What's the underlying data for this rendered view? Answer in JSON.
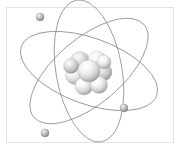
{
  "figure": {
    "caption": "",
    "background_color": "#ffffff",
    "frame": {
      "border_color": "#e2e2e2",
      "fill_color": "#ffffff",
      "x": 6,
      "y": 7,
      "width": 168,
      "height": 136
    },
    "nucleus": {
      "name": "nucleus",
      "center_x": 89,
      "center_y": 71,
      "radius": 23,
      "sphere_color_light": "#ffffff",
      "sphere_color_mid": "#d9d9d9",
      "sphere_color_dark": "#9a9a9a",
      "nucleon_count": 9,
      "nucleons": [
        {
          "cx": 80,
          "cy": 61,
          "r": 9.5
        },
        {
          "cx": 97,
          "cy": 60,
          "r": 9.0
        },
        {
          "cx": 75,
          "cy": 75,
          "r": 9.5
        },
        {
          "cx": 103,
          "cy": 72,
          "r": 9.0
        },
        {
          "cx": 84,
          "cy": 86,
          "r": 9.0
        },
        {
          "cx": 99,
          "cy": 85,
          "r": 8.5
        },
        {
          "cx": 71,
          "cy": 66,
          "r": 7.5
        },
        {
          "cx": 104,
          "cy": 62,
          "r": 7.0
        },
        {
          "cx": 89,
          "cy": 71,
          "r": 11.0
        }
      ]
    },
    "orbits": {
      "name": "electron-orbits",
      "stroke_color": "#8d8d8d",
      "stroke_width": 0.8,
      "center_x": 89,
      "center_y": 71,
      "radius_x": 72,
      "radius_y": 33,
      "count": 3,
      "rotations_deg": [
        20,
        80,
        140
      ]
    },
    "electrons": {
      "name": "electrons",
      "count": 3,
      "color_light": "#f2f2f2",
      "color_mid": "#c2c2c2",
      "color_dark": "#8a8a8a",
      "radius": 4,
      "positions": [
        {
          "label": "electron-top-left",
          "cx": 40,
          "cy": 17
        },
        {
          "label": "electron-right",
          "cx": 124,
          "cy": 108
        },
        {
          "label": "electron-bottom-left",
          "cx": 45,
          "cy": 133
        }
      ]
    }
  }
}
